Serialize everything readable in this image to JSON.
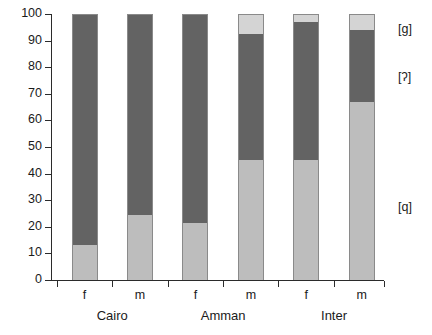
{
  "chart_data": {
    "type": "bar",
    "stacked": true,
    "title": "",
    "xlabel": "",
    "ylabel": "",
    "ylim": [
      0,
      100
    ],
    "ytick_labels": [
      "0",
      "10",
      "20",
      "30",
      "40",
      "50",
      "60",
      "70",
      "80",
      "90",
      "100"
    ],
    "yticks": [
      0,
      10,
      20,
      30,
      40,
      50,
      60,
      70,
      80,
      90,
      100
    ],
    "grid": false,
    "legend_position": "right",
    "categories": [
      "f",
      "m",
      "f",
      "m",
      "f",
      "m"
    ],
    "groups": [
      {
        "label": "Cairo",
        "members": [
          "f",
          "m"
        ]
      },
      {
        "label": "Amman",
        "members": [
          "f",
          "m"
        ]
      },
      {
        "label": "Inter",
        "members": [
          "f",
          "m"
        ]
      }
    ],
    "series": [
      {
        "name": "[q]",
        "color": "#bdbdbd",
        "values": [
          13,
          24.5,
          21.5,
          45,
          45,
          67
        ]
      },
      {
        "name": "[ʔ]",
        "color": "#636363",
        "values": [
          87,
          75.5,
          78.5,
          47.5,
          52,
          27
        ]
      },
      {
        "name": "[ɡ]",
        "color": "#d4d4d4",
        "values": [
          0,
          0,
          0,
          7.5,
          3,
          6
        ]
      }
    ],
    "legend": [
      {
        "label": "[ɡ]",
        "color": "#d4d4d4",
        "y_pct": 94
      },
      {
        "label": "[ʔ]",
        "color": "#636363",
        "y_pct": 76
      },
      {
        "label": "[q]",
        "color": "#bdbdbd",
        "y_pct": 27
      }
    ],
    "bars": [
      {
        "name": "Cairo-f",
        "x_pct": 9.8,
        "q": 13,
        "glottal": 87,
        "g": 0
      },
      {
        "name": "Cairo-m",
        "x_pct": 26.5,
        "q": 24.5,
        "glottal": 75.5,
        "g": 0
      },
      {
        "name": "Amman-f",
        "x_pct": 43.2,
        "q": 21.5,
        "glottal": 78.5,
        "g": 0
      },
      {
        "name": "Amman-m",
        "x_pct": 59.9,
        "q": 45,
        "glottal": 47.5,
        "g": 7.5
      },
      {
        "name": "Inter-f",
        "x_pct": 76.6,
        "q": 45,
        "glottal": 52,
        "g": 3
      },
      {
        "name": "Inter-m",
        "x_pct": 93.3,
        "q": 67,
        "glottal": 27,
        "g": 6
      }
    ]
  },
  "colors": {
    "series_q": "#bdbdbd",
    "series_glottal": "#636363",
    "series_g": "#d4d4d4",
    "axis": "#2b2b2b",
    "text": "#1a1a1a",
    "background": "#ffffff"
  }
}
